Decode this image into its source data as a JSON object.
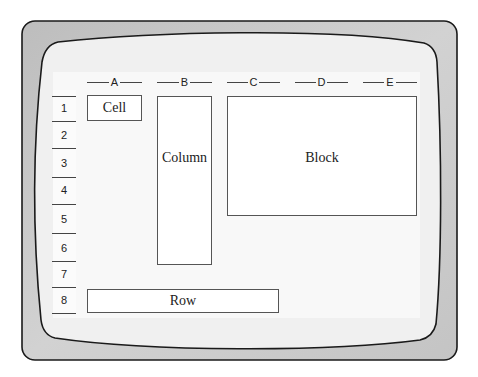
{
  "diagram": {
    "columns": [
      "A",
      "B",
      "C",
      "D",
      "E"
    ],
    "rows": [
      "1",
      "2",
      "3",
      "4",
      "5",
      "6",
      "7",
      "8"
    ],
    "regions": {
      "cell": "Cell",
      "column": "Column",
      "block": "Block",
      "row": "Row"
    },
    "colors": {
      "bezel": "#cdcdcd",
      "screen": "#f0f0f0",
      "grid_area": "#f8f8f8",
      "outline": "#1a1a1a",
      "box_fill": "#ffffff",
      "box_border": "#555555"
    }
  }
}
